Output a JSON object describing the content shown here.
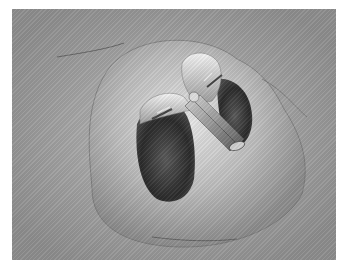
{
  "image": {
    "description": "Grayscale medical illustration of a ring-shaped tissue opening with a surgical instrument/device clip between two leaflets",
    "colors": {
      "background": "#9a9a9a",
      "highlight": "#e6e6e6",
      "shadow": "#2e2e2e",
      "border": "#ffffff"
    }
  }
}
